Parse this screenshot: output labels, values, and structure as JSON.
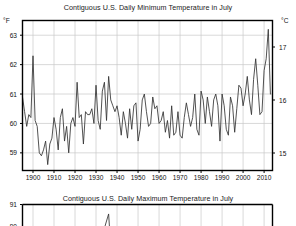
{
  "chart_data": [
    {
      "id": "minimum-temperature",
      "type": "line",
      "title": "Contiguous U.S. Daily Minimum Temperature in July",
      "xlabel": "",
      "ylabel": "°F",
      "ylabel_right": "°C",
      "grid": true,
      "legend": "none",
      "xlim": [
        1895,
        2014
      ],
      "ylim": [
        58.4,
        63.5
      ],
      "ylim_right": [
        14.67,
        17.5
      ],
      "xticks": [
        1900,
        1910,
        1920,
        1930,
        1940,
        1950,
        1960,
        1970,
        1980,
        1990,
        2000,
        2010
      ],
      "xtick_labels": [
        "1900",
        "1910",
        "1920",
        "1930",
        "1940",
        "1950",
        "1960",
        "1970",
        "1980",
        "1990",
        "2000",
        "2010"
      ],
      "yticks": [
        59,
        60,
        61,
        62,
        63
      ],
      "ytick_labels": [
        "59",
        "60",
        "61",
        "62",
        "63"
      ],
      "yticks_right": [
        15,
        16,
        17
      ],
      "ytick_labels_right": [
        "15",
        "16",
        "17"
      ],
      "line_color": "#333333",
      "grid_color": "#c8c8c8",
      "axis_color": "#000000",
      "x": [
        1895,
        1896,
        1897,
        1898,
        1899,
        1900,
        1901,
        1902,
        1903,
        1904,
        1905,
        1906,
        1907,
        1908,
        1909,
        1910,
        1911,
        1912,
        1913,
        1914,
        1915,
        1916,
        1917,
        1918,
        1919,
        1920,
        1921,
        1922,
        1923,
        1924,
        1925,
        1926,
        1927,
        1928,
        1929,
        1930,
        1931,
        1932,
        1933,
        1934,
        1935,
        1936,
        1937,
        1938,
        1939,
        1940,
        1941,
        1942,
        1943,
        1944,
        1945,
        1946,
        1947,
        1948,
        1949,
        1950,
        1951,
        1952,
        1953,
        1954,
        1955,
        1956,
        1957,
        1958,
        1959,
        1960,
        1961,
        1962,
        1963,
        1964,
        1965,
        1966,
        1967,
        1968,
        1969,
        1970,
        1971,
        1972,
        1973,
        1974,
        1975,
        1976,
        1977,
        1978,
        1979,
        1980,
        1981,
        1982,
        1983,
        1984,
        1985,
        1986,
        1987,
        1988,
        1989,
        1990,
        1991,
        1992,
        1993,
        1994,
        1995,
        1996,
        1997,
        1998,
        1999,
        2000,
        2001,
        2002,
        2003,
        2004,
        2005,
        2006,
        2007,
        2008,
        2009,
        2010,
        2011,
        2012,
        2013
      ],
      "y": [
        60.9,
        60.4,
        59.9,
        60.3,
        60.2,
        62.3,
        60.1,
        59.9,
        59.0,
        58.9,
        59.1,
        59.4,
        58.6,
        59.3,
        59.5,
        60.2,
        59.8,
        59.1,
        60.2,
        60.5,
        59.4,
        59.9,
        59.0,
        60.0,
        60.2,
        59.9,
        61.4,
        60.2,
        60.3,
        59.3,
        60.4,
        60.3,
        60.3,
        60.5,
        60.0,
        61.3,
        60.1,
        59.8,
        61.1,
        61.4,
        60.1,
        61.6,
        60.8,
        60.6,
        60.4,
        60.6,
        60.2,
        59.6,
        60.4,
        60.0,
        59.5,
        60.5,
        59.8,
        60.6,
        60.7,
        59.4,
        59.8,
        60.8,
        61.0,
        60.4,
        59.9,
        60.0,
        60.9,
        60.5,
        60.6,
        60.0,
        60.1,
        60.4,
        59.7,
        60.1,
        59.5,
        60.6,
        59.6,
        59.7,
        60.4,
        59.6,
        59.5,
        60.2,
        60.7,
        60.3,
        59.9,
        60.2,
        61.0,
        59.8,
        59.6,
        61.1,
        60.8,
        60.0,
        60.9,
        60.4,
        59.9,
        60.8,
        61.0,
        60.6,
        59.4,
        61.0,
        60.6,
        59.8,
        59.6,
        60.9,
        60.6,
        59.7,
        60.5,
        61.3,
        61.2,
        60.6,
        61.0,
        61.6,
        60.8,
        60.3,
        61.5,
        62.2,
        61.3,
        60.3,
        60.4,
        61.8,
        62.2,
        63.2,
        61.0
      ]
    },
    {
      "id": "maximum-temperature",
      "type": "line",
      "title": "Contiguous U.S. Daily Maximum Temperature in July",
      "xlabel": "",
      "ylabel": "°F",
      "grid": true,
      "legend": "none",
      "xlim": [
        1895,
        2014
      ],
      "ylim": [
        89.8,
        91.4
      ],
      "yticks": [
        91,
        90
      ],
      "ytick_labels": [
        "91",
        "90"
      ],
      "line_color": "#333333",
      "grid_color": "#c8c8c8",
      "axis_color": "#000000",
      "x": [
        1895,
        1900,
        1905,
        1910,
        1915,
        1920,
        1925,
        1930,
        1934,
        1936,
        1937,
        1940,
        1945,
        1950,
        1955,
        1960,
        1965,
        1970,
        1975,
        1980,
        1985,
        1990,
        1995,
        2000,
        2005,
        2010,
        2013
      ],
      "y": [
        90.2,
        90.4,
        90.0,
        90.3,
        90.1,
        90.2,
        90.4,
        90.6,
        90.9,
        91.2,
        90.5,
        90.4,
        90.2,
        90.1,
        90.3,
        90.2,
        90.0,
        90.1,
        90.2,
        90.5,
        90.2,
        90.3,
        90.1,
        90.3,
        90.4,
        90.6,
        90.3
      ]
    }
  ],
  "axis_labels": {
    "top_left_unit": "°F",
    "top_right_unit": "°C",
    "bottom_left_unit": ""
  }
}
